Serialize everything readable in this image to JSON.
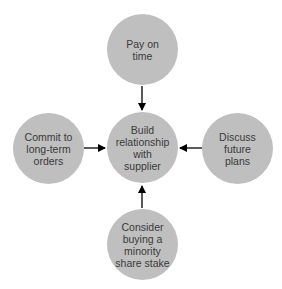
{
  "diagram": {
    "nodes": [
      {
        "id": "center",
        "label": "Build relationship with supplier",
        "lines": [
          "Build",
          "relationship",
          "with",
          "supplier"
        ]
      },
      {
        "id": "top",
        "label": "Pay on time",
        "lines": [
          "Pay on",
          "time"
        ]
      },
      {
        "id": "left",
        "label": "Commit to long-term orders",
        "lines": [
          "Commit to",
          "long-term",
          "orders"
        ]
      },
      {
        "id": "right",
        "label": "Discuss future plans",
        "lines": [
          "Discuss",
          "future",
          "plans"
        ]
      },
      {
        "id": "bottom",
        "label": "Consider buying a minority share stake",
        "lines": [
          "Consider",
          "buying a",
          "minority",
          "share stake"
        ]
      }
    ],
    "edges": [
      {
        "from": "top",
        "to": "center"
      },
      {
        "from": "left",
        "to": "center"
      },
      {
        "from": "right",
        "to": "center"
      },
      {
        "from": "bottom",
        "to": "center"
      }
    ],
    "colors": {
      "node_fill": "#bfbfbf",
      "text": "#3a3a3a",
      "arrow": "#000000"
    }
  }
}
